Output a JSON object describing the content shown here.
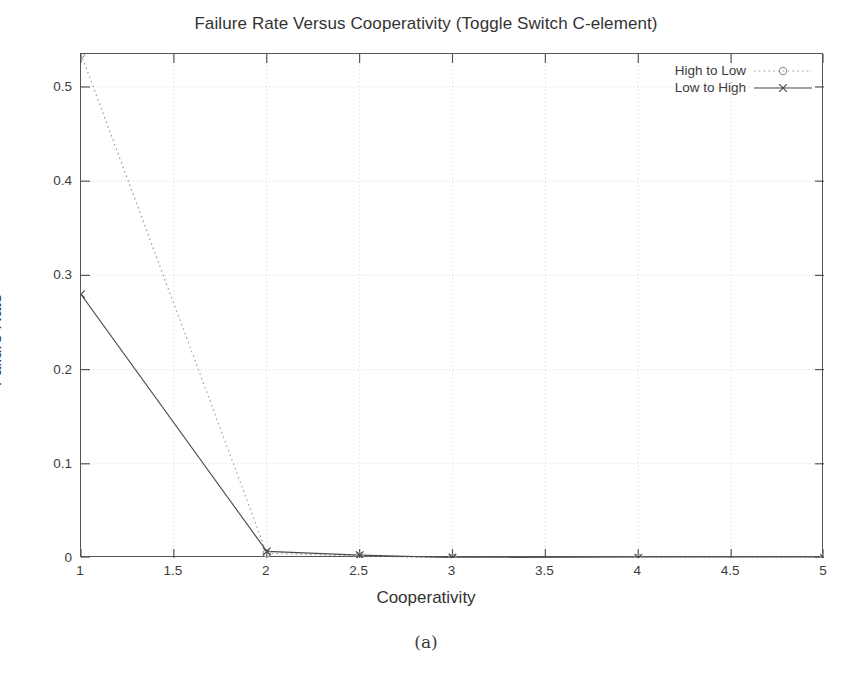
{
  "chart_data": {
    "type": "line",
    "title": "Failure Rate Versus Cooperativity (Toggle Switch C-element)",
    "xlabel": "Cooperativity",
    "ylabel": "Failure Rate",
    "xlim": [
      1,
      5
    ],
    "ylim": [
      0,
      0.535
    ],
    "grid": true,
    "legend_position": "top-right",
    "xticks": [
      "1",
      "1.5",
      "2",
      "2.5",
      "3",
      "3.5",
      "4",
      "4.5",
      "5"
    ],
    "xtick_values": [
      1,
      1.5,
      2,
      2.5,
      3,
      3.5,
      4,
      4.5,
      5
    ],
    "yticks": [
      "0",
      "0.1",
      "0.2",
      "0.3",
      "0.4",
      "0.5"
    ],
    "ytick_values": [
      0,
      0.1,
      0.2,
      0.3,
      0.4,
      0.5
    ],
    "x": [
      1,
      2,
      2.5,
      3,
      4,
      5
    ],
    "series": [
      {
        "name": "High to Low",
        "style": "dotted",
        "marker": "circle",
        "color": "#9a9a9a",
        "values": [
          0.535,
          0.005,
          0.002,
          0.0,
          0.0,
          0.0
        ]
      },
      {
        "name": "Low to High",
        "style": "solid",
        "marker": "cross",
        "color": "#4a4a4a",
        "values": [
          0.28,
          0.007,
          0.003,
          0.0005,
          0.0,
          0.0
        ]
      }
    ]
  },
  "caption": {
    "text": "(a)"
  },
  "icons": {
    "circle_marker": "circle-marker-icon",
    "cross_marker": "cross-marker-icon"
  }
}
